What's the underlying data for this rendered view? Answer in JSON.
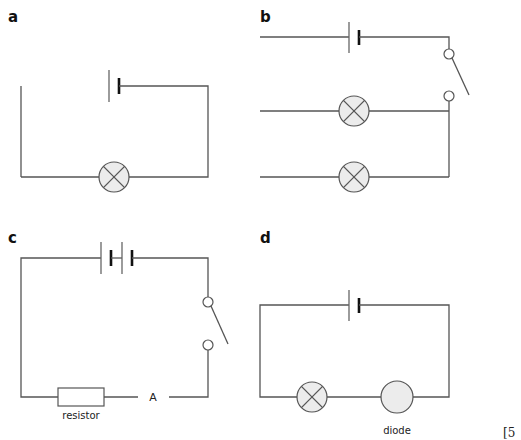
{
  "figure": {
    "marks": "[5",
    "colors": {
      "wire": "#555555",
      "lamp_fill": "#ececec",
      "background": "#ffffff"
    }
  },
  "circuits": [
    {
      "id": "a",
      "label": "a",
      "components": [
        "cell",
        "lamp"
      ],
      "note": "circuit open: left wire not connected to cell"
    },
    {
      "id": "b",
      "label": "b",
      "components": [
        "cell",
        "switch",
        "lamp",
        "lamp"
      ],
      "note": "lamps in parallel branches, left ends not connected"
    },
    {
      "id": "c",
      "label": "c",
      "components": [
        "cell",
        "cell",
        "switch",
        "resistor",
        "ammeter"
      ],
      "resistor_label": "resistor",
      "ammeter_label": "A"
    },
    {
      "id": "d",
      "label": "d",
      "components": [
        "cell",
        "lamp",
        "diode"
      ],
      "diode_label": "diode"
    }
  ]
}
